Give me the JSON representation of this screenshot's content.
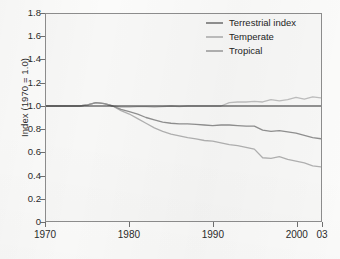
{
  "chart_data": {
    "type": "line",
    "title": "",
    "subtitle": "",
    "xlabel": "",
    "ylabel": "Index (1970 = 1.0)",
    "xlim": [
      1970,
      2003
    ],
    "ylim": [
      0,
      1.8
    ],
    "grid": false,
    "legend_position": "top-right",
    "reference_line": {
      "y": 1.0,
      "color": "#2a2a2a",
      "label": ""
    },
    "x_tick_labels": [
      "1970",
      "1980",
      "1990",
      "2000",
      "03"
    ],
    "x_tick_values": [
      1970,
      1980,
      1990,
      2000,
      2003
    ],
    "y_tick_labels": [
      "0",
      "0.2",
      "0.4",
      "0.6",
      "0.8",
      "1.0",
      "1.2",
      "1.4",
      "1.6",
      "1.8"
    ],
    "y_tick_values": [
      0,
      0.2,
      0.4,
      0.6,
      0.8,
      1.0,
      1.2,
      1.4,
      1.6,
      1.8
    ],
    "x": [
      1970,
      1971,
      1972,
      1973,
      1974,
      1975,
      1976,
      1977,
      1978,
      1979,
      1980,
      1981,
      1982,
      1983,
      1984,
      1985,
      1986,
      1987,
      1988,
      1989,
      1990,
      1991,
      1992,
      1993,
      1994,
      1995,
      1996,
      1997,
      1998,
      1999,
      2000,
      2001,
      2002,
      2003
    ],
    "series": [
      {
        "name": "Terrestrial index",
        "color": "#8f8f8f",
        "values": [
          1.0,
          1.0,
          1.0,
          1.0,
          1.0,
          1.01,
          1.03,
          1.02,
          1.0,
          0.97,
          0.95,
          0.93,
          0.9,
          0.88,
          0.86,
          0.85,
          0.845,
          0.845,
          0.84,
          0.835,
          0.83,
          0.835,
          0.835,
          0.83,
          0.825,
          0.825,
          0.79,
          0.78,
          0.785,
          0.775,
          0.765,
          0.745,
          0.725,
          0.715
        ]
      },
      {
        "name": "Temperate",
        "color": "#bdbdbd",
        "values": [
          1.0,
          1.0,
          1.0,
          1.0,
          1.0,
          1.01,
          1.03,
          1.02,
          1.0,
          0.99,
          0.99,
          0.995,
          0.995,
          0.99,
          0.995,
          1.0,
          0.995,
          1.0,
          1.0,
          1.0,
          1.0,
          1.0,
          1.03,
          1.035,
          1.035,
          1.04,
          1.035,
          1.055,
          1.045,
          1.055,
          1.075,
          1.06,
          1.08,
          1.07
        ]
      },
      {
        "name": "Tropical",
        "color": "#b0b0b0",
        "values": [
          1.0,
          1.0,
          1.0,
          1.0,
          1.0,
          1.01,
          1.03,
          1.02,
          1.0,
          0.96,
          0.93,
          0.89,
          0.85,
          0.81,
          0.78,
          0.755,
          0.74,
          0.725,
          0.715,
          0.7,
          0.695,
          0.68,
          0.665,
          0.655,
          0.64,
          0.625,
          0.55,
          0.545,
          0.56,
          0.535,
          0.52,
          0.505,
          0.48,
          0.47
        ]
      }
    ]
  },
  "legend": {
    "entries": [
      {
        "label": "Terrestrial index"
      },
      {
        "label": "Temperate"
      },
      {
        "label": "Tropical"
      }
    ]
  },
  "axes": {
    "y_title": "Index (1970 = 1.0)"
  }
}
